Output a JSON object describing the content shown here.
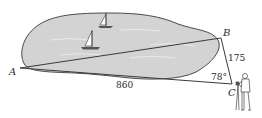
{
  "diagram": {
    "type": "surveying-triangle",
    "points": {
      "A": {
        "label": "A",
        "x": 20,
        "y": 68
      },
      "B": {
        "label": "B",
        "x": 221,
        "y": 38
      },
      "C": {
        "label": "C",
        "x": 232,
        "y": 84
      }
    },
    "measurements": {
      "side_AC": "860",
      "side_BC": "175",
      "angle_C": "78°"
    },
    "elements": [
      "lake",
      "sailboat",
      "sailboat",
      "surveyor"
    ]
  },
  "colors": {
    "lake_fill": "#d3d3d3",
    "outline": "#4a4a4a",
    "line": "#3a3a3a",
    "text": "#2a2a2a",
    "background": "#ffffff"
  }
}
